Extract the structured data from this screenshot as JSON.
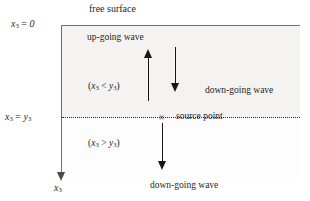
{
  "figure": {
    "type": "schematic-diagram",
    "colors": {
      "background": "#ffffff",
      "medium_fill": "#f4f3f1",
      "line": "#6e6e70",
      "arrow": "#17171a",
      "text": "#1f1f22"
    }
  },
  "boundaries": {
    "free_surface": {
      "label": "free surface",
      "depth_label": "x₃ = 0",
      "depth_label_parts": {
        "var": "x",
        "sub": "3",
        "rel": " = ",
        "value": "0"
      },
      "style": "solid"
    },
    "source_level": {
      "depth_label": "x₃ = y₃",
      "depth_label_parts": {
        "var": "x",
        "sub": "3",
        "rel": " = ",
        "value": "y",
        "value_sub": "3"
      },
      "marker": "×",
      "marker_label": "source point",
      "style": "dotted"
    }
  },
  "axis": {
    "name": "x₃",
    "name_var": "x",
    "name_sub": "3",
    "direction": "downward"
  },
  "regions": [
    {
      "id": "above-source",
      "condition": "(x₃ < y₃)",
      "cond_open": "(",
      "cond_var": "x",
      "cond_sub": "3",
      "cond_rel": " < ",
      "cond_var2": "y",
      "cond_sub2": "3",
      "cond_close": ")"
    },
    {
      "id": "below-source",
      "condition": "(x₃ > y₃)",
      "cond_open": "(",
      "cond_var": "x",
      "cond_sub": "3",
      "cond_rel": " > ",
      "cond_var2": "y",
      "cond_sub2": "3",
      "cond_close": ")"
    }
  ],
  "waves": [
    {
      "id": "up-going",
      "label": "up-going wave",
      "direction": "up",
      "region": "above-source"
    },
    {
      "id": "down-going-upper",
      "label": "down-going wave",
      "direction": "down",
      "region": "above-source"
    },
    {
      "id": "down-going-lower",
      "label": "down-going wave",
      "direction": "down",
      "region": "below-source"
    }
  ]
}
